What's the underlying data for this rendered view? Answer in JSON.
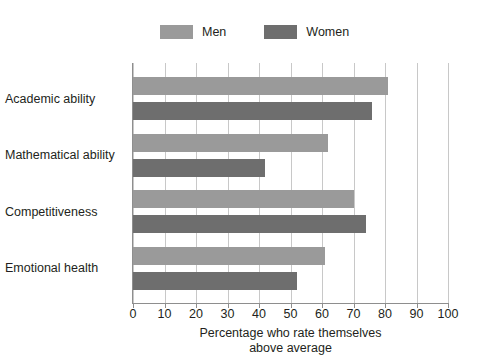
{
  "chart_data": {
    "type": "bar",
    "orientation": "horizontal",
    "title": "",
    "subtitle": "",
    "categories": [
      "Academic ability",
      "Mathematical ability",
      "Competitiveness",
      "Emotional health"
    ],
    "series": [
      {
        "name": "Men",
        "color": "#9a9a9a",
        "values": [
          81,
          62,
          70,
          61
        ]
      },
      {
        "name": "Women",
        "color": "#6e6e6e",
        "values": [
          76,
          42,
          74,
          52
        ]
      }
    ],
    "xlabel_line1": "Percentage who rate themselves",
    "xlabel_line2": "above average",
    "ylabel": "",
    "xlim": [
      0,
      100
    ],
    "xticks": [
      0,
      10,
      20,
      30,
      40,
      50,
      60,
      70,
      80,
      90,
      100
    ],
    "xtick_labels": [
      "0",
      "10",
      "20",
      "30",
      "40",
      "50",
      "60",
      "70",
      "80",
      "90",
      "100"
    ],
    "grid": "vertical",
    "legend_position": "top-center",
    "axis_color": "#8e8e8e",
    "grid_color": "#c8c8c8",
    "background": "#ffffff"
  },
  "legend": {
    "entries": [
      {
        "label": "Men",
        "color": "#9a9a9a"
      },
      {
        "label": "Women",
        "color": "#6e6e6e"
      }
    ]
  }
}
